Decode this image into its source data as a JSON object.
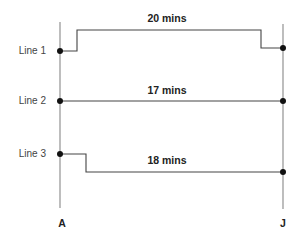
{
  "diagram": {
    "endpoints": [
      {
        "id": "start",
        "label": "A",
        "x": 60,
        "label_x": 62,
        "label_y": 226,
        "y_top": 22,
        "y_bottom": 208
      },
      {
        "id": "end",
        "label": "J",
        "x": 283,
        "label_x": 283,
        "label_y": 226,
        "y_top": 24,
        "y_bottom": 209
      }
    ],
    "lines": [
      {
        "name": "Line 1",
        "duration": "20 mins",
        "label_y": 54,
        "duration_x": 167,
        "duration_y": 22,
        "path": "M60,51 L77,51 L77,30 L261,30 L261,48 L283,48",
        "start_dot": [
          60,
          51
        ],
        "end_dot": [
          283,
          48
        ]
      },
      {
        "name": "Line 2",
        "duration": "17 mins",
        "label_y": 104,
        "duration_x": 167,
        "duration_y": 94,
        "path": "M60,101 L283,101",
        "start_dot": [
          60,
          101
        ],
        "end_dot": [
          283,
          101
        ]
      },
      {
        "name": "Line 3",
        "duration": "18 mins",
        "label_y": 157,
        "duration_x": 167,
        "duration_y": 164,
        "path": "M60,154 L86,154 L86,172 L283,172",
        "start_dot": [
          60,
          154
        ],
        "end_dot": [
          283,
          172
        ]
      }
    ]
  }
}
